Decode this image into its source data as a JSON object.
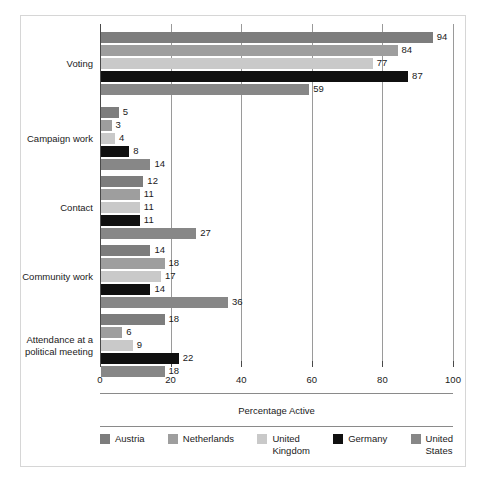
{
  "chart_data": {
    "type": "bar",
    "orientation": "horizontal",
    "title": "",
    "xlabel": "Percentage Active",
    "ylabel": "",
    "xlim": [
      0,
      100
    ],
    "xticks": [
      0,
      20,
      40,
      60,
      80,
      100
    ],
    "grid": "vertical",
    "legend_position": "bottom",
    "categories": [
      "Voting",
      "Campaign work",
      "Contact",
      "Community work",
      "Attendance at a\npolitical meeting"
    ],
    "series": [
      {
        "name": "Austria",
        "color": "#7d7d7d",
        "values": [
          94,
          5,
          12,
          14,
          18
        ]
      },
      {
        "name": "Netherlands",
        "color": "#9e9e9e",
        "values": [
          84,
          3,
          11,
          18,
          6
        ]
      },
      {
        "name": "United\nKingdom",
        "color": "#c9c9c9",
        "values": [
          77,
          4,
          11,
          17,
          9
        ]
      },
      {
        "name": "Germany",
        "color": "#101010",
        "values": [
          87,
          8,
          11,
          14,
          22
        ]
      },
      {
        "name": "United\nStates",
        "color": "#878787",
        "values": [
          59,
          14,
          27,
          36,
          18
        ]
      }
    ]
  },
  "axis": {
    "tick_labels": [
      "0",
      "20",
      "40",
      "60",
      "80",
      "100"
    ]
  },
  "legend": {
    "items": [
      {
        "label": "Austria"
      },
      {
        "label": "Netherlands"
      },
      {
        "label": "United\nKingdom"
      },
      {
        "label": "Germany"
      },
      {
        "label": "United\nStates"
      }
    ]
  },
  "xaxis_title": "Percentage Active",
  "colors": {
    "frame_border": "#d6d6d6",
    "gridline": "#9a9a9a",
    "axis": "#4a4a4a",
    "text": "#1a1a1a"
  }
}
